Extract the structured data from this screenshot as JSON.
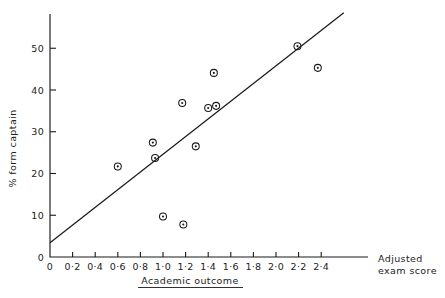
{
  "chart_data": {
    "type": "scatter",
    "title": "",
    "xlabel": "Academic outcome",
    "xlabel_secondary_line1": "Adjusted",
    "xlabel_secondary_line2": "exam score",
    "ylabel": "% form captain",
    "xlim": [
      0,
      2.6
    ],
    "ylim": [
      0,
      57
    ],
    "grid": false,
    "legend": "none",
    "xticks": [
      0,
      0.2,
      0.4,
      0.6,
      0.8,
      1.0,
      1.2,
      1.4,
      1.6,
      1.8,
      2.0,
      2.2,
      2.4
    ],
    "xtick_labels": [
      "0",
      "0·2",
      "0·4",
      "0·6",
      "0·8",
      "1·0",
      "1·2",
      "1·4",
      "1·6",
      "1·8",
      "2·0",
      "2·2",
      "2·4"
    ],
    "yticks": [
      0,
      10,
      20,
      30,
      40,
      50
    ],
    "ytick_labels": [
      "0",
      "10",
      "20",
      "30",
      "40",
      "50"
    ],
    "marker": "circle-with-center-dot",
    "points": [
      {
        "x": 0.6,
        "y": 21.7
      },
      {
        "x": 0.91,
        "y": 27.4
      },
      {
        "x": 0.93,
        "y": 23.7
      },
      {
        "x": 1.0,
        "y": 9.7
      },
      {
        "x": 1.17,
        "y": 36.9
      },
      {
        "x": 1.18,
        "y": 7.8
      },
      {
        "x": 1.29,
        "y": 26.5
      },
      {
        "x": 1.4,
        "y": 35.7
      },
      {
        "x": 1.45,
        "y": 44.1
      },
      {
        "x": 1.47,
        "y": 36.2
      },
      {
        "x": 2.19,
        "y": 50.5
      },
      {
        "x": 2.37,
        "y": 45.3
      }
    ],
    "fit_line": {
      "name": "regression line",
      "x0": 0.0,
      "y0": 3.4,
      "x1": 2.6,
      "y1": 58.5
    }
  },
  "labels": {
    "y_axis_title": "% form captain",
    "x_axis_title": "Academic outcome",
    "x_axis_right_line1": "Adjusted",
    "x_axis_right_line2": "exam score"
  },
  "colors": {
    "ink": "#1a1a1a",
    "background": "#ffffff"
  }
}
